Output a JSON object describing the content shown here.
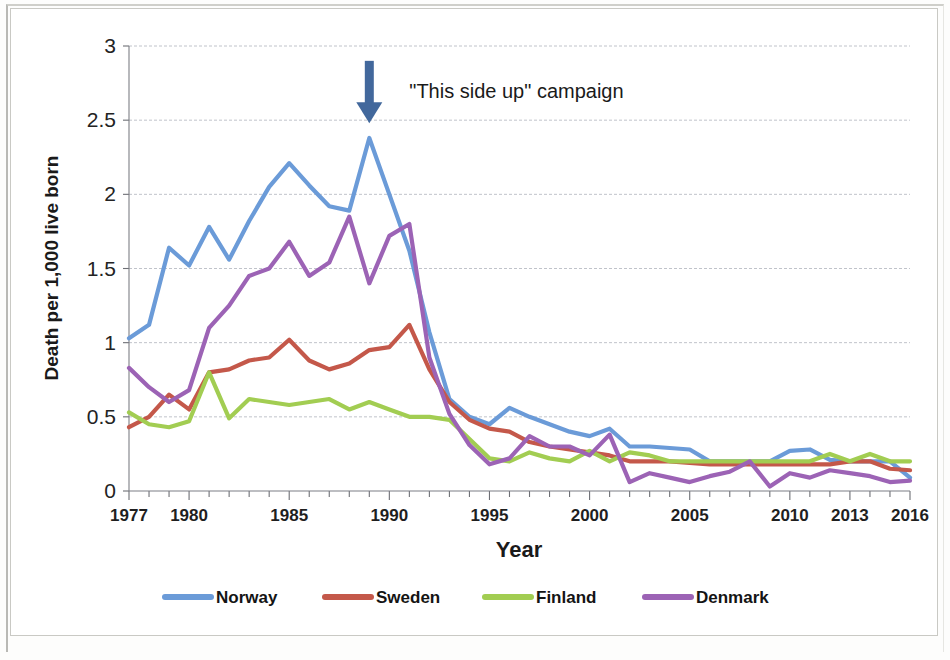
{
  "chart_data": {
    "type": "line",
    "title": "",
    "xlabel": "Year",
    "ylabel": "Death per 1,000 live born",
    "xlim": [
      1977,
      2016
    ],
    "ylim": [
      0,
      3
    ],
    "yticks": [
      "0",
      "0.5",
      "1",
      "1.5",
      "2",
      "2.5",
      "3"
    ],
    "ytick_values": [
      0,
      0.5,
      1,
      1.5,
      2,
      2.5,
      3
    ],
    "xticks": [
      "1977",
      "1980",
      "1985",
      "1990",
      "1995",
      "2000",
      "2005",
      "2010",
      "2013",
      "2016"
    ],
    "xtick_values": [
      1977,
      1980,
      1985,
      1990,
      1995,
      2000,
      2005,
      2010,
      2013,
      2016
    ],
    "grid": "horizontal",
    "legend_position": "bottom",
    "x": [
      1977,
      1978,
      1979,
      1980,
      1981,
      1982,
      1983,
      1984,
      1985,
      1986,
      1987,
      1988,
      1989,
      1990,
      1991,
      1992,
      1993,
      1994,
      1995,
      1996,
      1997,
      1998,
      1999,
      2000,
      2001,
      2002,
      2003,
      2004,
      2005,
      2006,
      2007,
      2008,
      2009,
      2010,
      2011,
      2012,
      2013,
      2014,
      2015,
      2016
    ],
    "series": [
      {
        "name": "Norway",
        "color": "#6b9bd8",
        "values": [
          1.03,
          1.12,
          1.64,
          1.52,
          1.78,
          1.56,
          1.82,
          2.05,
          2.21,
          2.06,
          1.92,
          1.89,
          2.38,
          2.0,
          1.62,
          1.07,
          0.62,
          0.5,
          0.45,
          0.56,
          0.5,
          0.45,
          0.4,
          0.37,
          0.42,
          0.3,
          0.3,
          0.29,
          0.28,
          0.2,
          0.2,
          0.2,
          0.2,
          0.27,
          0.28,
          0.21,
          0.2,
          0.2,
          0.2,
          0.09
        ]
      },
      {
        "name": "Sweden",
        "color": "#c4584a",
        "values": [
          0.43,
          0.5,
          0.65,
          0.55,
          0.8,
          0.82,
          0.88,
          0.9,
          1.02,
          0.88,
          0.82,
          0.86,
          0.95,
          0.97,
          1.12,
          0.82,
          0.6,
          0.48,
          0.42,
          0.4,
          0.33,
          0.3,
          0.28,
          0.26,
          0.24,
          0.2,
          0.2,
          0.2,
          0.19,
          0.18,
          0.18,
          0.18,
          0.18,
          0.18,
          0.18,
          0.18,
          0.2,
          0.2,
          0.15,
          0.14
        ]
      },
      {
        "name": "Finland",
        "color": "#a2cd52",
        "values": [
          0.53,
          0.45,
          0.43,
          0.47,
          0.8,
          0.49,
          0.62,
          0.6,
          0.58,
          0.6,
          0.62,
          0.55,
          0.6,
          0.55,
          0.5,
          0.5,
          0.48,
          0.35,
          0.22,
          0.2,
          0.26,
          0.22,
          0.2,
          0.27,
          0.2,
          0.26,
          0.24,
          0.2,
          0.2,
          0.2,
          0.2,
          0.2,
          0.2,
          0.2,
          0.2,
          0.25,
          0.2,
          0.25,
          0.2,
          0.2
        ]
      },
      {
        "name": "Denmark",
        "color": "#9c63b5",
        "values": [
          0.83,
          0.7,
          0.6,
          0.68,
          1.1,
          1.25,
          1.45,
          1.5,
          1.68,
          1.45,
          1.54,
          1.85,
          1.4,
          1.72,
          1.8,
          0.9,
          0.52,
          0.31,
          0.18,
          0.22,
          0.37,
          0.3,
          0.3,
          0.24,
          0.38,
          0.06,
          0.12,
          0.09,
          0.06,
          0.1,
          0.13,
          0.2,
          0.03,
          0.12,
          0.09,
          0.14,
          0.12,
          0.1,
          0.06,
          0.07
        ]
      }
    ],
    "annotations": [
      {
        "text": "\"This side up\" campaign",
        "marker": "down-arrow",
        "marker_color": "#42689c",
        "x": 1989,
        "y_top": 2.9,
        "y_bottom": 2.48
      }
    ]
  },
  "legend": {
    "items": [
      {
        "label": "Norway",
        "color": "#6b9bd8"
      },
      {
        "label": "Sweden",
        "color": "#c4584a"
      },
      {
        "label": "Finland",
        "color": "#a2cd52"
      },
      {
        "label": "Denmark",
        "color": "#9c63b5"
      }
    ]
  }
}
